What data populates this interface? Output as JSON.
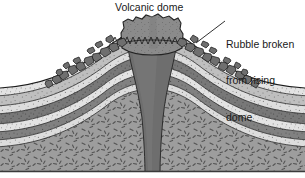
{
  "figure": {
    "type": "geologic-cross-section",
    "subject": "Volcanic dome",
    "background_color": "#ffffff",
    "width": 305,
    "height": 178
  },
  "labels": {
    "title": "Volcanic dome",
    "rubble": "Rubble broken\nfrom rising\ndome",
    "rubble_line1": "Rubble broken",
    "rubble_line2": "from rising",
    "rubble_line3": "dome"
  },
  "features": {
    "dome": {
      "name": "volcanic-dome-body",
      "color": "#8a8a8a",
      "description": "rounded jagged intrusive dome at summit"
    },
    "conduit": {
      "name": "magma-conduit",
      "color": "#6e6e6e",
      "description": "funnel shaped feeder neck narrowing downward"
    },
    "rubble": {
      "name": "rubble-blocks",
      "color": "#6b6b6b",
      "description": "angular broken blocks cascading down both flanks"
    },
    "basement": {
      "name": "basement-rock",
      "color": "#9a9a9a",
      "pattern": "dashes",
      "description": "metamorphic basement with scattered dash texture"
    }
  },
  "strata": [
    {
      "name": "layer-1-light",
      "color": "#dcdcdc",
      "pattern": "stipple"
    },
    {
      "name": "layer-2-dark",
      "color": "#767676",
      "pattern": "stipple-dark"
    },
    {
      "name": "layer-3-light",
      "color": "#e2e2e2",
      "pattern": "stipple"
    },
    {
      "name": "layer-4-dark",
      "color": "#7d7d7d",
      "pattern": "stipple-dark"
    },
    {
      "name": "layer-5-light",
      "color": "#dedede",
      "pattern": "stipple"
    },
    {
      "name": "layer-6-medium",
      "color": "#bdbdbd",
      "pattern": "stipple"
    },
    {
      "name": "layer-7-light",
      "color": "#e6e6e6",
      "pattern": "stipple"
    }
  ],
  "colors": {
    "outline": "#1a1a1a",
    "text": "#1a1a1a",
    "leader_line": "#1a1a1a"
  }
}
